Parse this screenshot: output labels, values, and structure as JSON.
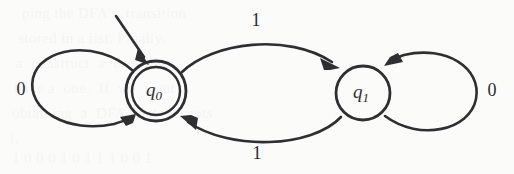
{
  "figure": {
    "kind": "finite-state-automaton-diagram",
    "background_color": "#fbfbfa",
    "ink_color": "#2e2e33",
    "width": 514,
    "height": 174
  },
  "states": [
    {
      "id": "q0",
      "label_base": "q",
      "label_sub": "0",
      "accepting": true,
      "start": true,
      "cx": 156,
      "cy": 91,
      "r_outer": 30,
      "r_inner": 24
    },
    {
      "id": "q1",
      "label_base": "q",
      "label_sub": "1",
      "accepting": false,
      "start": false,
      "cx": 363,
      "cy": 93,
      "r_outer": 27,
      "r_inner": 0
    }
  ],
  "transitions": [
    {
      "name": "q0-self-loop",
      "from": "q0",
      "to": "q0",
      "symbol": "0",
      "label_x": 21,
      "label_y": 91,
      "shape": "left-self-loop"
    },
    {
      "name": "q0-to-q1",
      "from": "q0",
      "to": "q1",
      "symbol": "1",
      "label_x": 256,
      "label_y": 22,
      "shape": "upper-arc"
    },
    {
      "name": "q1-to-q0",
      "from": "q1",
      "to": "q0",
      "symbol": "1",
      "label_x": 257,
      "label_y": 155,
      "shape": "lower-arc"
    },
    {
      "name": "q1-self-loop",
      "from": "q1",
      "to": "q1",
      "symbol": "0",
      "label_x": 492,
      "label_y": 92,
      "shape": "right-self-loop"
    }
  ],
  "start_marker": {
    "name": "start-arrow",
    "target_state": "q0",
    "from_x": 116,
    "from_y": 16,
    "to_x": 146,
    "to_y": 62
  },
  "ghost_text": {
    "note": "faint show-through of printed text behind the figure",
    "lines": [
      {
        "text": "ping the DFA's  transition",
        "x": 22,
        "y": 6
      },
      {
        "text": "stored in a list. Finally,",
        "x": 18,
        "y": 31
      },
      {
        "text": "a  construct  a  transition",
        "x": 16,
        "y": 56
      },
      {
        "text": "have a  one.  If  we  want",
        "x": 14,
        "y": 81
      },
      {
        "text": "obtaining  a  DFA  that  accepts",
        "x": 12,
        "y": 106
      },
      {
        "text": "l,",
        "x": 10,
        "y": 131
      },
      {
        "text": "1 0 0 0 1 0 1 1 1 0 0 1",
        "x": 12,
        "y": 150
      }
    ]
  }
}
